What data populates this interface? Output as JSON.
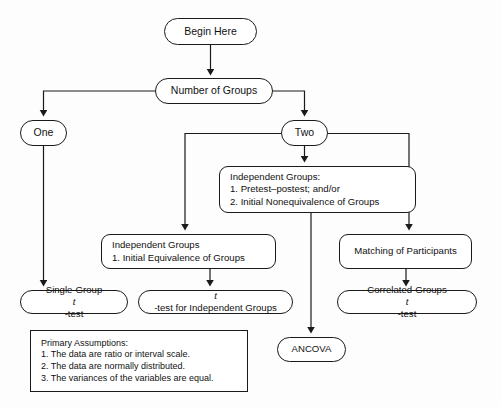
{
  "diagram": {
    "type": "flowchart",
    "background_color": "#fdfdfd",
    "stroke_color": "#1a1a1a",
    "fill_color": "#ffffff"
  },
  "nodes": {
    "begin": {
      "label": "Begin Here",
      "shape": "pill"
    },
    "groups": {
      "label": "Number of Groups",
      "shape": "pill"
    },
    "one": {
      "label": "One",
      "shape": "pill"
    },
    "two": {
      "label": "Two",
      "shape": "pill"
    },
    "independent_pretest": {
      "shape": "rounded",
      "line1": "Independent Groups:",
      "line2": "1. Pretest–postest; and/or",
      "line3": "2. Initial Nonequivalence of Groups"
    },
    "independent_equivalence": {
      "shape": "rounded",
      "line1": "Independent Groups",
      "line2": "1. Initial Equivalence of Groups"
    },
    "matching": {
      "label": "Matching of Participants",
      "shape": "rounded"
    },
    "single_group_t": {
      "shape": "pill",
      "prefix": "Single-Group ",
      "italic": "t",
      "suffix": "-test"
    },
    "t_for_independent": {
      "shape": "pill",
      "prefix": "",
      "italic": "t",
      "suffix": "-test for Independent Groups"
    },
    "correlated_groups_t": {
      "shape": "pill",
      "prefix": "Correlated-Groups ",
      "italic": "t",
      "suffix": "-test"
    },
    "ancova": {
      "label": "ANCOVA",
      "shape": "pill"
    },
    "assumptions": {
      "shape": "rect",
      "line1": "Primary Assumptions:",
      "line2": "1. The data are ratio or interval scale.",
      "line3": "2. The data are normally distributed.",
      "line4": "3. The variances of the variables are equal."
    }
  },
  "edges": [
    {
      "from": "begin",
      "to": "groups"
    },
    {
      "from": "groups",
      "to": "one"
    },
    {
      "from": "groups",
      "to": "two"
    },
    {
      "from": "two",
      "to": "independent_pretest"
    },
    {
      "from": "two",
      "to": "independent_equivalence"
    },
    {
      "from": "two",
      "to": "matching"
    },
    {
      "from": "one",
      "to": "single_group_t"
    },
    {
      "from": "independent_equivalence",
      "to": "t_for_independent"
    },
    {
      "from": "matching",
      "to": "correlated_groups_t"
    },
    {
      "from": "independent_pretest",
      "to": "ancova"
    }
  ]
}
